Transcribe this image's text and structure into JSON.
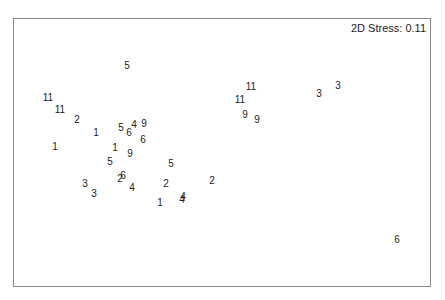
{
  "chart_data": {
    "type": "scatter",
    "title": "",
    "subtitle": "",
    "annotation": "2D Stress: 0.11",
    "xlabel": "",
    "ylabel": "",
    "grid": false,
    "legend": null,
    "axes_visible": false,
    "frame": true,
    "coordinate_note": "Points are NMDS ordination positions given in image pixel space (x right, y down); the plot has no axes or tick labels.",
    "points": [
      {
        "label": "5",
        "x": 127,
        "y": 66
      },
      {
        "label": "11",
        "x": 48,
        "y": 98
      },
      {
        "label": "11",
        "x": 60,
        "y": 110
      },
      {
        "label": "2",
        "x": 77,
        "y": 120
      },
      {
        "label": "1",
        "x": 96,
        "y": 133
      },
      {
        "label": "5",
        "x": 121,
        "y": 128
      },
      {
        "label": "6",
        "x": 129,
        "y": 133
      },
      {
        "label": "4",
        "x": 134,
        "y": 125
      },
      {
        "label": "9",
        "x": 144,
        "y": 124
      },
      {
        "label": "6",
        "x": 143,
        "y": 140
      },
      {
        "label": "1",
        "x": 55,
        "y": 147
      },
      {
        "label": "1",
        "x": 115,
        "y": 148
      },
      {
        "label": "9",
        "x": 130,
        "y": 154
      },
      {
        "label": "5",
        "x": 110,
        "y": 162
      },
      {
        "label": "5",
        "x": 171,
        "y": 164
      },
      {
        "label": "6",
        "x": 123,
        "y": 176
      },
      {
        "label": "2",
        "x": 120,
        "y": 179
      },
      {
        "label": "3",
        "x": 85,
        "y": 184
      },
      {
        "label": "3",
        "x": 94,
        "y": 194
      },
      {
        "label": "4",
        "x": 132,
        "y": 188
      },
      {
        "label": "2",
        "x": 166,
        "y": 184
      },
      {
        "label": "2",
        "x": 212,
        "y": 181
      },
      {
        "label": "1",
        "x": 160,
        "y": 203
      },
      {
        "label": "4",
        "x": 183,
        "y": 197
      },
      {
        "label": "4",
        "x": 182,
        "y": 200
      },
      {
        "label": "11",
        "x": 251,
        "y": 87
      },
      {
        "label": "11",
        "x": 240,
        "y": 100
      },
      {
        "label": "9",
        "x": 245,
        "y": 115
      },
      {
        "label": "9",
        "x": 257,
        "y": 120
      },
      {
        "label": "3",
        "x": 319,
        "y": 94
      },
      {
        "label": "3",
        "x": 338,
        "y": 86
      },
      {
        "label": "6",
        "x": 397,
        "y": 240
      }
    ]
  }
}
